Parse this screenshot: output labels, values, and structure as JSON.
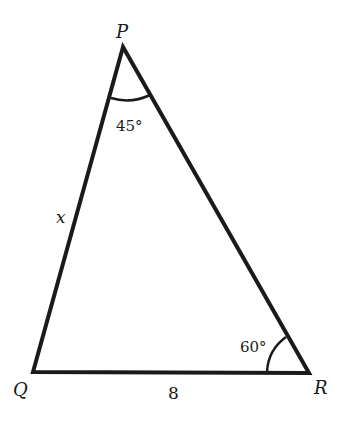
{
  "diagram": {
    "type": "triangle",
    "vertices": [
      {
        "name": "P",
        "label": "P"
      },
      {
        "name": "Q",
        "label": "Q"
      },
      {
        "name": "R",
        "label": "R"
      }
    ],
    "angles": {
      "P": "45°",
      "R": "60°"
    },
    "sides": {
      "PQ": "x",
      "QR": "8"
    },
    "colors": {
      "stroke": "#1a1a1a",
      "background": "#ffffff"
    }
  }
}
